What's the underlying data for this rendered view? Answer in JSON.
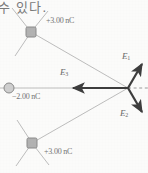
{
  "figure": {
    "caption_fragment": "수 있다.",
    "charges": [
      {
        "id": "top",
        "label": "+3.00 nC",
        "marker": "square",
        "x": 31,
        "y": 32
      },
      {
        "id": "middle",
        "label": "−2.00 nC",
        "marker": "circle",
        "x": 9,
        "y": 88
      },
      {
        "id": "bottom",
        "label": "+3.00 nC",
        "marker": "square",
        "x": 32,
        "y": 143
      }
    ],
    "field_vectors": [
      {
        "id": "E1",
        "label": "E",
        "subscript": "1",
        "from_x": 128,
        "from_y": 88,
        "to_x": 143,
        "to_y": 63
      },
      {
        "id": "E2",
        "label": "E",
        "subscript": "2",
        "from_x": 128,
        "from_y": 88,
        "to_x": 143,
        "to_y": 113
      },
      {
        "id": "E3",
        "label": "E",
        "subscript": "3",
        "from_x": 128,
        "from_y": 88,
        "to_x": 71,
        "to_y": 88
      }
    ],
    "field_point": {
      "x": 128,
      "y": 88
    },
    "axis_line": {
      "style": "dashed",
      "from_x": 128,
      "from_y": 88,
      "to_x": 148,
      "to_y": 88
    },
    "arc": {
      "center_x": 128,
      "center_y": 88,
      "radius": 119,
      "start_angle_deg": -152,
      "end_angle_deg": 152
    },
    "colors": {
      "arc": "#9a9a9a",
      "ray": "#a8a8a8",
      "vector": "#3d3d3d",
      "marker_fill": "#b2b2b2",
      "marker_stroke": "#8a8a8a",
      "label_text": "#737373",
      "background": "#fbfbfa"
    }
  }
}
